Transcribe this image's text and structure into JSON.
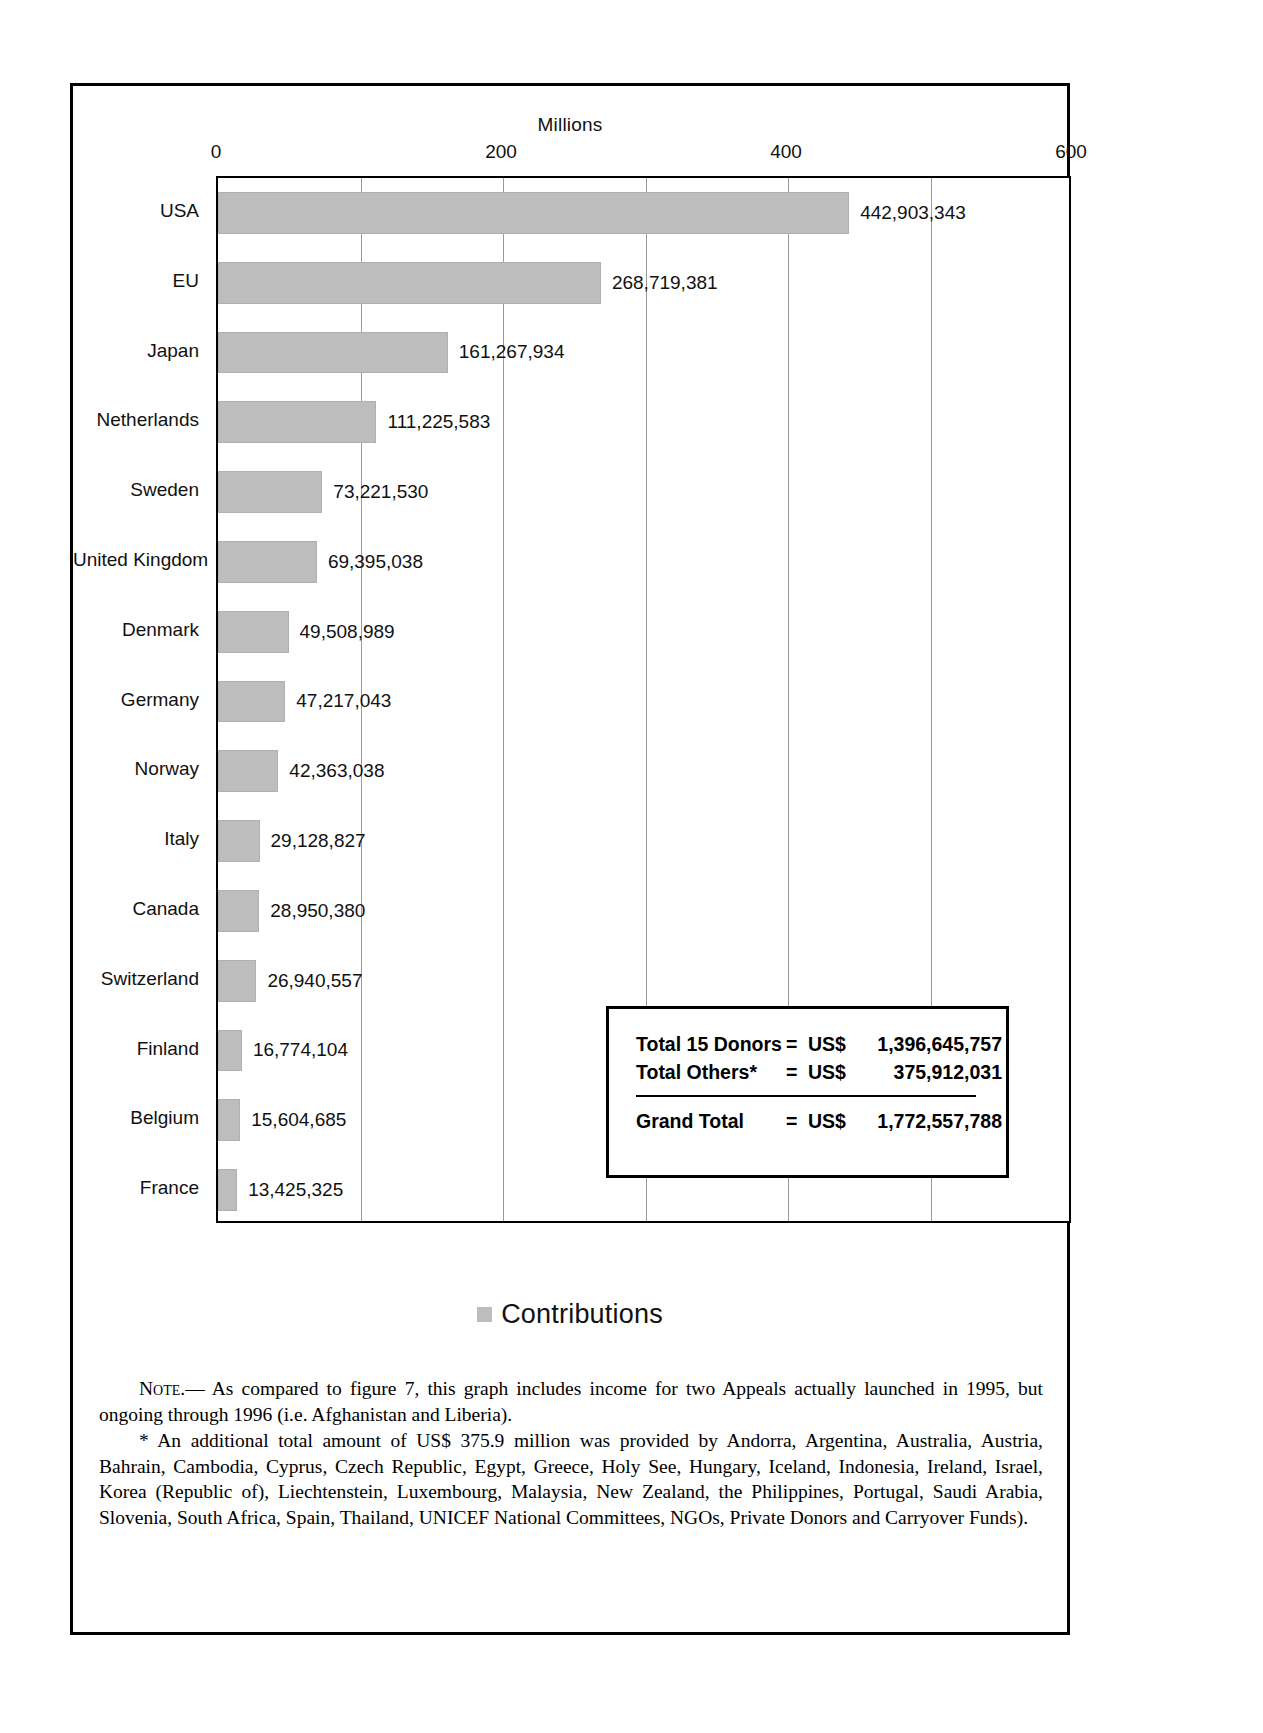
{
  "chart_data": {
    "type": "bar",
    "orientation": "horizontal",
    "title": "",
    "xlabel": "Millions",
    "ylabel": "",
    "xlim": [
      0,
      600
    ],
    "grid": true,
    "gridlines": [
      0,
      100,
      200,
      300,
      400,
      500,
      600
    ],
    "tick_labels": [
      "0",
      "200",
      "400",
      "600"
    ],
    "tick_values": [
      0,
      200,
      400,
      600
    ],
    "legend": {
      "position": "bottom",
      "entries": [
        "Contributions"
      ]
    },
    "series_name": "Contributions",
    "bar_color": "#bdbdbd",
    "categories": [
      "USA",
      "EU",
      "Japan",
      "Netherlands",
      "Sweden",
      "United Kingdom",
      "Denmark",
      "Germany",
      "Norway",
      "Italy",
      "Canada",
      "Switzerland",
      "Finland",
      "Belgium",
      "France"
    ],
    "values": [
      442903343,
      268719381,
      161267934,
      111225583,
      73221530,
      69395038,
      49508989,
      47217043,
      42363038,
      29128827,
      28950380,
      26940557,
      16774104,
      15604685,
      13425325
    ],
    "value_labels": [
      "442,903,343",
      "268,719,381",
      "161,267,934",
      "111,225,583",
      "73,221,530",
      "69,395,038",
      "49,508,989",
      "47,217,043",
      "42,363,038",
      "29,128,827",
      "28,950,380",
      "26,940,557",
      "16,774,104",
      "15,604,685",
      "13,425,325"
    ]
  },
  "totals": {
    "rows": [
      {
        "label": "Total 15 Donors",
        "eq": "=",
        "currency": "US$",
        "amount": "1,396,645,757"
      },
      {
        "label": "Total Others*",
        "eq": "=",
        "currency": "US$",
        "amount": "375,912,031"
      }
    ],
    "grand": {
      "label": "Grand Total",
      "eq": "=",
      "currency": "US$",
      "amount": "1,772,557,788"
    }
  },
  "legend": {
    "swatch_name": "contributions-swatch",
    "label": "Contributions"
  },
  "note": {
    "prefix": "Note",
    "body": ".— As compared to figure 7, this graph includes income for two Appeals actually launched in 1995, but ongoing through 1996 (i.e. Afghanistan and Liberia).",
    "footnote": "* An additional total amount of US$ 375.9 million was provided by Andorra, Argentina, Australia, Austria, Bahrain, Cambodia, Cyprus, Czech Republic, Egypt, Greece, Holy See, Hungary, Iceland, Indonesia, Ireland, Israel, Korea (Republic of), Liechtenstein, Luxembourg, Malaysia, New Zealand, the Philippines, Portugal, Saudi Arabia, Slovenia, South Africa, Spain, Thailand, UNICEF National Committees, NGOs, Private Donors and Carryover Funds)."
  }
}
